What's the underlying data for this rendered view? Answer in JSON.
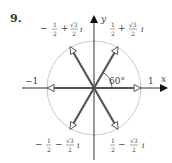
{
  "problem_number": "9.",
  "diagram": {
    "type": "complex-plane-roots-of-unity",
    "axes": {
      "x_label": "x",
      "y_label": "y"
    },
    "unit_circle": true,
    "angle_label": "60°",
    "points": [
      {
        "label_real": "1",
        "position": "right"
      },
      {
        "label_real": "−1",
        "position": "left"
      },
      {
        "sign": "−",
        "num": "1",
        "den": "2",
        "op": "+",
        "rad": "√3",
        "rden": "2",
        "i": "i",
        "position": "upper-left"
      },
      {
        "sign": "",
        "num": "1",
        "den": "2",
        "op": "+",
        "rad": "√3",
        "rden": "2",
        "i": "i",
        "position": "upper-right"
      },
      {
        "sign": "−",
        "num": "1",
        "den": "2",
        "op": "−",
        "rad": "√3",
        "rden": "2",
        "i": "i",
        "position": "lower-left"
      },
      {
        "sign": "",
        "num": "1",
        "den": "2",
        "op": "−",
        "rad": "√3",
        "rden": "2",
        "i": "i",
        "position": "lower-right"
      }
    ],
    "colors": {
      "vector": "#555555",
      "circle": "#c8c8c8",
      "axis": "#333333",
      "text": "#444444"
    }
  }
}
